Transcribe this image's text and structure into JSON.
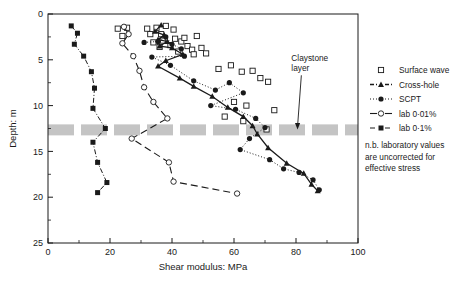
{
  "chart_data": {
    "type": "scatter",
    "title": "",
    "xlabel": "Shear modulus: MPa",
    "ylabel": "Depth: m",
    "xlim": [
      0,
      100
    ],
    "ylim": [
      0,
      25
    ],
    "y_inverted": true,
    "xticks": [
      0,
      20,
      40,
      60,
      80,
      100
    ],
    "yticks": [
      0,
      5,
      10,
      15,
      20,
      25
    ],
    "xticks_minor": [
      10,
      30,
      50,
      70,
      90
    ],
    "yticks_minor": [
      2.5,
      7.5,
      12.5,
      17.5,
      22.5
    ],
    "grid": false,
    "legend_position": "right",
    "annotations": [
      {
        "name": "claystone-layer",
        "text_line1": "Claystone",
        "text_line2": "layer",
        "x": 78.5,
        "y": 5.6,
        "arrow_to_x": 80.5,
        "arrow_to_y": 12.6
      },
      {
        "name": "lab-note",
        "text_line1": "n.b. laboratory values",
        "text_line2": "are uncorrected for",
        "text_line3": "effective stress"
      }
    ],
    "bands": [
      {
        "name": "claystone-layer-band",
        "label": "Claystone layer",
        "y_from": 12.05,
        "y_to": 13.25,
        "color": "#c4c4c4",
        "style": "dashed"
      }
    ],
    "series": [
      {
        "name": "Surface wave",
        "marker": "open-square",
        "line": "none",
        "color": "#1a1a1a",
        "points": [
          [
            22.5,
            1.6
          ],
          [
            25.5,
            1.5
          ],
          [
            24.0,
            2.4
          ],
          [
            32.0,
            1.6
          ],
          [
            35.0,
            1.5
          ],
          [
            33.0,
            2.2
          ],
          [
            36.5,
            2.2
          ],
          [
            38.0,
            1.3
          ],
          [
            40.5,
            1.7
          ],
          [
            37.0,
            2.9
          ],
          [
            41.0,
            2.7
          ],
          [
            34.0,
            3.1
          ],
          [
            36.0,
            3.6
          ],
          [
            39.5,
            3.4
          ],
          [
            43.0,
            3.0
          ],
          [
            45.0,
            3.5
          ],
          [
            42.0,
            4.1
          ],
          [
            46.5,
            3.9
          ],
          [
            49.5,
            3.7
          ],
          [
            47.0,
            4.4
          ],
          [
            51.0,
            4.3
          ],
          [
            44.0,
            2.6
          ],
          [
            48.0,
            2.4
          ],
          [
            55.0,
            6.0
          ],
          [
            59.0,
            5.6
          ],
          [
            62.5,
            6.3
          ],
          [
            66.0,
            6.2
          ],
          [
            68.5,
            7.0
          ],
          [
            71.0,
            7.4
          ],
          [
            60.0,
            9.6
          ],
          [
            64.0,
            10.0
          ],
          [
            73.0,
            10.5
          ],
          [
            63.0,
            11.7
          ],
          [
            70.5,
            12.6
          ],
          [
            57.0,
            11.2
          ]
        ]
      },
      {
        "name": "Cross-hole",
        "marker": "filled-triangle",
        "line": "dashed-solid",
        "color": "#1a1a1a",
        "points": [
          [
            36.5,
            1.2
          ],
          [
            34.5,
            1.9
          ],
          [
            37.5,
            2.3
          ],
          [
            35.5,
            2.8
          ],
          [
            38.5,
            3.0
          ],
          [
            36.0,
            3.5
          ],
          [
            40.0,
            3.7
          ],
          [
            43.5,
            4.4
          ],
          [
            38.0,
            5.1
          ],
          [
            35.5,
            5.7
          ],
          [
            42.5,
            7.0
          ],
          [
            47.0,
            7.9
          ],
          [
            53.0,
            9.0
          ],
          [
            58.0,
            10.2
          ],
          [
            63.0,
            11.2
          ],
          [
            66.0,
            12.2
          ],
          [
            67.5,
            13.1
          ],
          [
            71.0,
            14.6
          ],
          [
            77.0,
            16.3
          ],
          [
            82.5,
            17.4
          ],
          [
            85.0,
            18.6
          ],
          [
            87.0,
            19.3
          ]
        ]
      },
      {
        "name": "SCPT",
        "marker": "filled-circle",
        "line": "dotted",
        "color": "#1a1a1a",
        "points": [
          [
            31.0,
            3.1
          ],
          [
            35.5,
            3.0
          ],
          [
            38.0,
            2.5
          ],
          [
            40.0,
            3.3
          ],
          [
            43.0,
            3.8
          ],
          [
            44.0,
            4.6
          ],
          [
            33.5,
            4.7
          ],
          [
            39.5,
            5.6
          ],
          [
            47.0,
            7.3
          ],
          [
            54.0,
            8.3
          ],
          [
            58.5,
            7.5
          ],
          [
            63.0,
            8.6
          ],
          [
            52.5,
            10.0
          ],
          [
            60.5,
            10.4
          ],
          [
            67.0,
            11.4
          ],
          [
            70.0,
            12.4
          ],
          [
            65.0,
            13.6
          ],
          [
            62.0,
            14.8
          ],
          [
            71.5,
            15.9
          ],
          [
            76.0,
            16.9
          ],
          [
            81.0,
            17.3
          ],
          [
            85.5,
            18.1
          ],
          [
            87.5,
            19.2
          ]
        ]
      },
      {
        "name": "lab 0·01%",
        "marker": "open-circle",
        "line": "long-dash",
        "color": "#1a1a1a",
        "points": [
          [
            24.5,
            1.4
          ],
          [
            26.0,
            2.2
          ],
          [
            24.0,
            3.2
          ],
          [
            27.5,
            4.6
          ],
          [
            29.5,
            6.2
          ],
          [
            31.0,
            8.0
          ],
          [
            34.0,
            9.6
          ],
          [
            38.5,
            11.4
          ],
          [
            27.0,
            13.6
          ],
          [
            39.0,
            16.2
          ],
          [
            40.5,
            18.3
          ],
          [
            61.0,
            19.6
          ]
        ]
      },
      {
        "name": "lab 0·1%",
        "marker": "filled-square",
        "line": "dash-dot",
        "color": "#1a1a1a",
        "points": [
          [
            7.5,
            1.3
          ],
          [
            9.5,
            2.1
          ],
          [
            8.5,
            3.3
          ],
          [
            11.5,
            4.6
          ],
          [
            14.0,
            6.3
          ],
          [
            15.0,
            8.1
          ],
          [
            14.5,
            10.3
          ],
          [
            18.5,
            12.5
          ],
          [
            14.5,
            14.0
          ],
          [
            16.0,
            16.2
          ],
          [
            19.0,
            18.4
          ],
          [
            16.0,
            19.5
          ]
        ]
      }
    ],
    "legend": [
      {
        "label": "Surface wave",
        "marker": "open-square",
        "line": "none"
      },
      {
        "label": "Cross-hole",
        "marker": "filled-triangle",
        "line": "dashed-solid"
      },
      {
        "label": "SCPT",
        "marker": "filled-circle",
        "line": "dotted"
      },
      {
        "label": "lab 0·01%",
        "marker": "open-circle",
        "line": "long-dash"
      },
      {
        "label": "lab 0·1%",
        "marker": "filled-square",
        "line": "dash-dot"
      }
    ]
  },
  "axes": {
    "x_label": "Shear modulus: MPa",
    "y_label": "Depth: m",
    "x_tick_labels": [
      "0",
      "20",
      "40",
      "60",
      "80",
      "100"
    ],
    "y_tick_labels": [
      "0",
      "5",
      "10",
      "15",
      "20",
      "25"
    ]
  },
  "legend": {
    "items": [
      {
        "label": "Surface wave"
      },
      {
        "label": "Cross-hole"
      },
      {
        "label": "SCPT"
      },
      {
        "label": "lab 0·01%"
      },
      {
        "label": "lab 0·1%"
      }
    ]
  },
  "annotations": {
    "claystone_line1": "Claystone",
    "claystone_line2": "layer",
    "note_line1": "n.b. laboratory values",
    "note_line2": "are uncorrected for",
    "note_line3": "effective stress"
  },
  "colors": {
    "ink": "#1a1a1a",
    "axis": "#1a1a1a",
    "band": "#c4c4c4",
    "background": "#ffffff"
  }
}
